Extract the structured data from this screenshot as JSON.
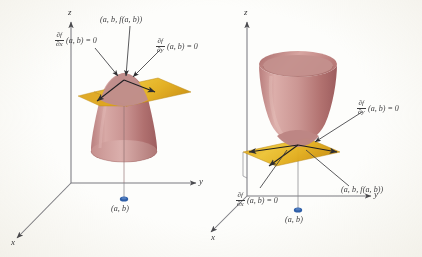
{
  "figure": {
    "kind": "two-panel 3D calculus diagram of critical points",
    "surface_color": "#c08b8b",
    "plane_color": "#e0a81e",
    "axis_color": "#6b6b70",
    "point_color": "#2f5fa8",
    "text_color": "#3a3a3c"
  },
  "left_panel": {
    "caption": "local maximum: downward-opening paraboloid with horizontal tangent plane",
    "axes": {
      "z": "z",
      "y": "y",
      "x": "x"
    },
    "labels": {
      "tangent_point": "(a, b, f(a, b))",
      "base_point": "(a, b)",
      "partial_x": {
        "numerator": "∂f",
        "denominator": "∂x",
        "tail": "(a, b) = 0"
      },
      "partial_y": {
        "numerator": "∂f",
        "denominator": "∂y",
        "tail": "(a, b) = 0"
      }
    }
  },
  "right_panel": {
    "caption": "local minimum: upward-opening paraboloid with horizontal tangent plane",
    "axes": {
      "z": "z",
      "y": "y",
      "x": "x"
    },
    "labels": {
      "tangent_point": "(a, b, f(a, b))",
      "base_point": "(a, b)",
      "partial_x": {
        "numerator": "∂f",
        "denominator": "∂x",
        "tail": "(a, b) = 0"
      },
      "partial_y": {
        "numerator": "∂f",
        "denominator": "∂y",
        "tail": "(a, b) = 0"
      }
    }
  }
}
